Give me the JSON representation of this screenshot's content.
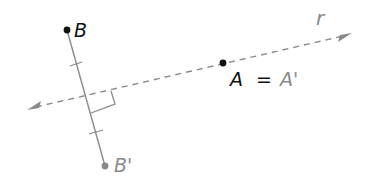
{
  "diagram": {
    "type": "reflection",
    "line": {
      "label": "r",
      "style": "dashed",
      "color": "#8a8a8a",
      "arrow_left": [
        27,
        110
      ],
      "arrow_right": [
        352,
        33
      ]
    },
    "points": {
      "A": {
        "label": "A",
        "xy": [
          223,
          63
        ],
        "color": "#111111"
      },
      "B": {
        "label": "B",
        "xy": [
          67,
          30
        ],
        "color": "#111111"
      },
      "B_prime": {
        "label": "B'",
        "xy": [
          105,
          166
        ],
        "color": "#8a8a8a"
      }
    },
    "labels": {
      "A_eq": "A",
      "equals": "=",
      "A_prime": "A'",
      "B": "B",
      "B_prime": "B'",
      "r": "r"
    },
    "segment": {
      "from": "B",
      "to": "B_prime",
      "color": "#8a8a8a",
      "congruence_ticks": 2
    },
    "right_angle_marker": true
  }
}
